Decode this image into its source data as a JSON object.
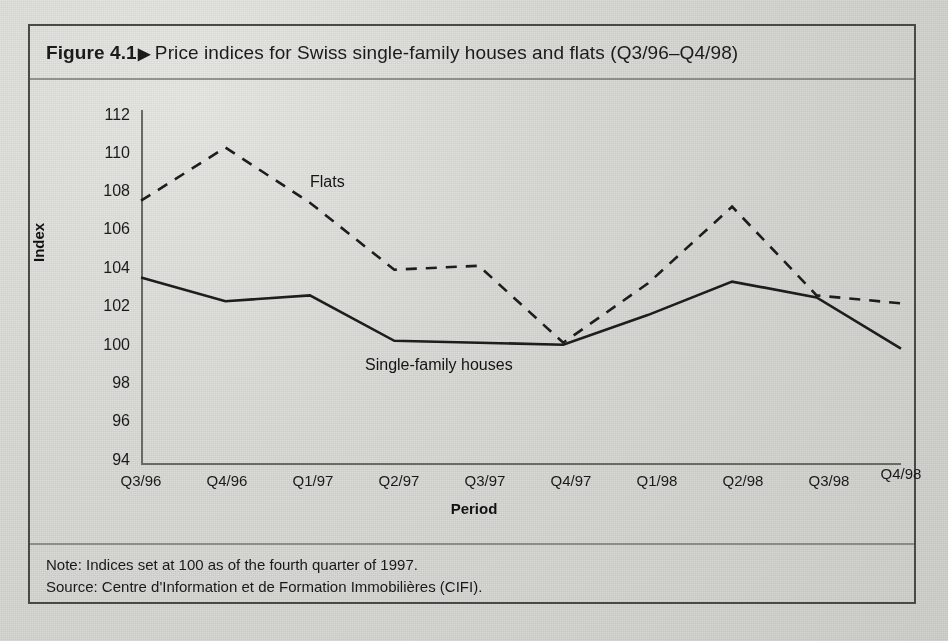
{
  "figure": {
    "number_label": "Figure 4.1",
    "marker": "▶",
    "title": "Price indices for Swiss single-family houses and flats (Q3/96–Q4/98)",
    "note": "Note: Indices set at 100 as of the fourth quarter of 1997.",
    "source": "Source: Centre d'Information et de Formation Immobilières (CIFI)."
  },
  "chart_data": {
    "type": "line",
    "title": "Price indices for Swiss single-family houses and flats (Q3/96–Q4/98)",
    "xlabel": "Period",
    "ylabel": "Index",
    "categories": [
      "Q3/96",
      "Q4/96",
      "Q1/97",
      "Q2/97",
      "Q3/97",
      "Q4/97",
      "Q1/98",
      "Q2/98",
      "Q3/98",
      "Q4/98"
    ],
    "ylim": [
      94,
      112
    ],
    "ytick_values": [
      94,
      96,
      98,
      100,
      102,
      104,
      106,
      108,
      110,
      112
    ],
    "ytick_labels": [
      "94",
      "96",
      "98",
      "100",
      "102",
      "104",
      "106",
      "108",
      "110",
      "112"
    ],
    "grid": false,
    "legend": "inline-annotations",
    "series": [
      {
        "name": "Flats",
        "style": "dashed",
        "color": "#1f1f1f",
        "values": [
          107.4,
          110.1,
          107.3,
          103.9,
          104.1,
          100.2,
          103.2,
          107.1,
          102.6,
          102.2
        ]
      },
      {
        "name": "Single-family houses",
        "style": "solid",
        "color": "#1f1f1f",
        "values": [
          103.5,
          102.3,
          102.6,
          100.3,
          100.2,
          100.1,
          101.6,
          103.3,
          102.5,
          99.9
        ]
      }
    ],
    "annotations": [
      {
        "text": "Flats",
        "series": "Flats"
      },
      {
        "text": "Single-family houses",
        "series": "Single-family houses"
      }
    ]
  }
}
